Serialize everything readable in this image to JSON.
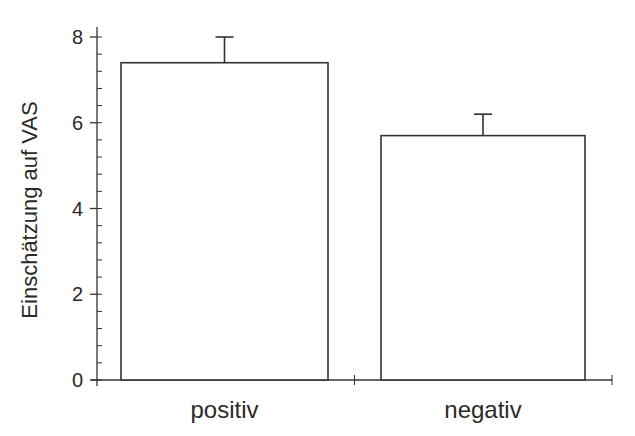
{
  "chart_data": {
    "type": "bar",
    "title": "",
    "xlabel": "",
    "ylabel": "Einschätzung auf VAS",
    "categories": [
      "positiv",
      "negativ"
    ],
    "values": [
      7.4,
      5.7
    ],
    "error_upper": [
      8.0,
      6.2
    ],
    "error_plus": [
      0.6,
      0.5
    ],
    "ylim": [
      0,
      8
    ],
    "yticks": [
      0,
      2,
      4,
      6,
      8
    ],
    "yminor_step": 0.4,
    "grid": false,
    "legend": null,
    "bar_fill": "#ffffff",
    "bar_edge": "#333333"
  }
}
